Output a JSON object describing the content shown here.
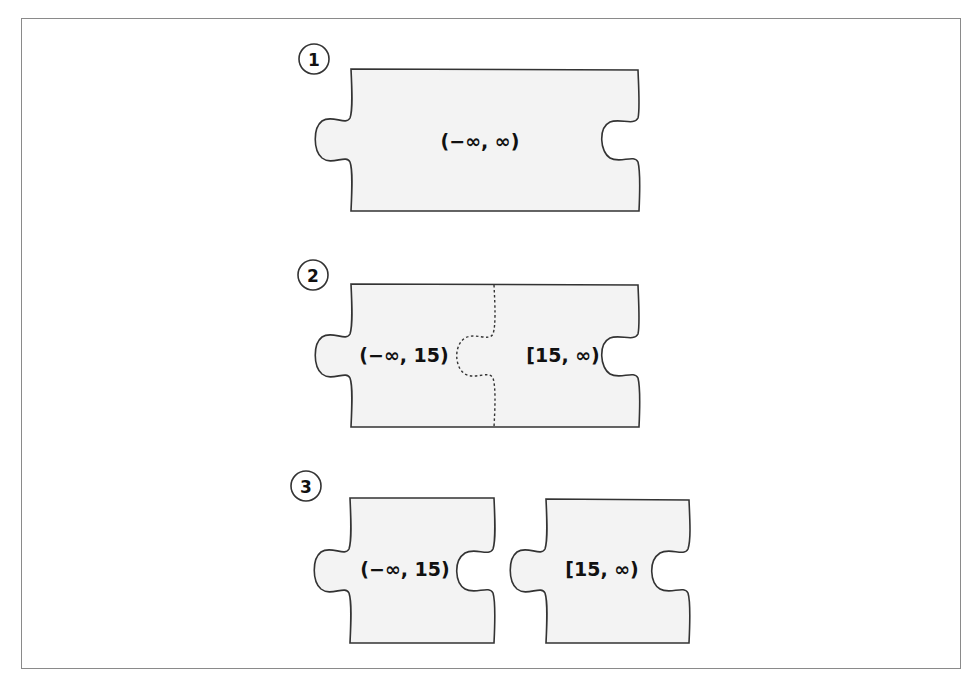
{
  "figure": {
    "steps": [
      {
        "number": "1",
        "pieces": [
          {
            "label": "(−∞, ∞)"
          }
        ]
      },
      {
        "number": "2",
        "pieces": [
          {
            "label": "(−∞, 15)"
          },
          {
            "label": "[15, ∞)"
          }
        ]
      },
      {
        "number": "3",
        "pieces": [
          {
            "label": "(−∞, 15)"
          },
          {
            "label": "[15, ∞)"
          }
        ]
      }
    ]
  },
  "colors": {
    "piece_fill": "#f3f3f3",
    "outline": "#333333",
    "frame_border": "#8a8a8a",
    "background": "#ffffff"
  }
}
